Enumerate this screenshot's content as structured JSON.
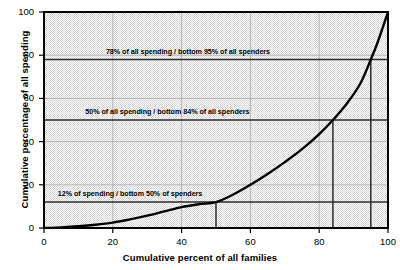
{
  "chart_data": {
    "type": "line",
    "title": "",
    "xlabel": "Cumulative percent of all families",
    "ylabel": "Cumulative percentage of all spending",
    "xlim": [
      0,
      100
    ],
    "ylim": [
      0,
      100
    ],
    "xticks": [
      "0",
      "20",
      "40",
      "60",
      "80",
      "100"
    ],
    "yticks": [
      "0",
      "20",
      "40",
      "60",
      "80",
      "100"
    ],
    "xtick_values": [
      0,
      20,
      40,
      60,
      80,
      100
    ],
    "ytick_values": [
      0,
      20,
      40,
      60,
      80,
      100
    ],
    "grid": true,
    "legend": "none",
    "series": [
      {
        "name": "Lorenz curve of spending",
        "x": [
          0,
          5,
          10,
          15,
          20,
          25,
          30,
          35,
          40,
          45,
          50,
          55,
          60,
          65,
          70,
          75,
          80,
          84,
          88,
          92,
          95,
          97,
          100
        ],
        "y": [
          0,
          0.3,
          0.8,
          1.5,
          2.5,
          4.0,
          5.7,
          7.7,
          9.7,
          11.0,
          12.0,
          15.5,
          20.0,
          25.0,
          30.5,
          36.5,
          43.5,
          50.0,
          57.5,
          67.0,
          78.0,
          86.0,
          100.0
        ]
      }
    ],
    "reference_lines": [
      {
        "name": "spending-78-line",
        "orientation": "horizontal",
        "value": 78
      },
      {
        "name": "spending-50-line",
        "orientation": "horizontal",
        "value": 50
      },
      {
        "name": "spending-12-line",
        "orientation": "horizontal",
        "value": 12
      },
      {
        "name": "spenders-95-line",
        "orientation": "vertical",
        "value": 95,
        "from": 0,
        "to": 78
      },
      {
        "name": "spenders-84-line",
        "orientation": "vertical",
        "value": 84,
        "from": 0,
        "to": 50
      },
      {
        "name": "spenders-50-line",
        "orientation": "vertical",
        "value": 50,
        "from": 0,
        "to": 12
      }
    ],
    "annotations": [
      {
        "name": "annotation-78-95",
        "text": "78% of all spending / bottom 95% of all spenders",
        "x": 18,
        "y": 82
      },
      {
        "name": "annotation-50-84",
        "text": "50% of all spending / bottom 84% of all spenders",
        "x": 12,
        "y": 54
      },
      {
        "name": "annotation-12-50",
        "text": "12% of spending / bottom 50% of spenders",
        "x": 4,
        "y": 16
      }
    ],
    "colors": {
      "curve": "#000000",
      "reference_line": "#2b2b2b",
      "grid": "#a8a8a8",
      "axis": "#000000",
      "plot_background": "#e4e4e4",
      "page_background": "#ffffff"
    }
  }
}
